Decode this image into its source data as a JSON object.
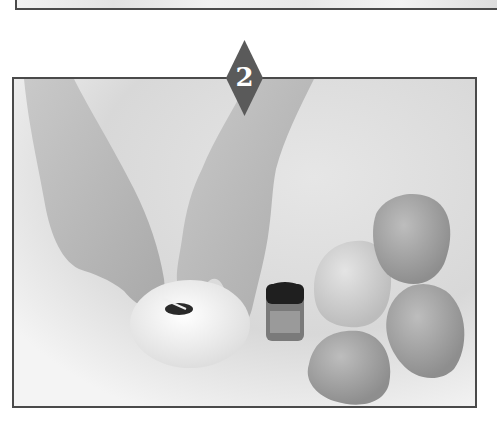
{
  "page": {
    "step_badge": {
      "number": "2",
      "color": "#5a5a5a",
      "text_color": "#ffffff"
    },
    "photo": {
      "description": "Hands adding a drop of food coloring to a ball of white dough; a small bottle of coloring and four other dough balls beside it",
      "frame_color": "#4a4a4a",
      "objects": [
        "left-hand",
        "right-hand",
        "white-dough-ball-with-coloring",
        "coloring-bottle",
        "dough-ball-1",
        "dough-ball-2",
        "dough-ball-3",
        "dough-ball-4"
      ]
    }
  }
}
